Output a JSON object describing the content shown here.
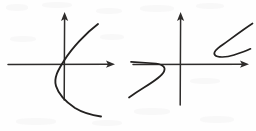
{
  "figure": {
    "medium": "pencil sketch on white paper",
    "background_color": "#fefefe",
    "ink_color": "#232120",
    "axis_color": "#2e2c2b",
    "panel_count": 2
  },
  "panels": [
    {
      "id": "left-graph",
      "name": "Sideways parabola opening right",
      "description": "A rightward-opening parabola whose vertex sits slightly left of the y-axis below the origin; the curve crosses the y-axis twice and both branches extend to the right.",
      "origin": {
        "x": 64,
        "y": 64
      },
      "axes": {
        "x_axis": {
          "start_x": 8,
          "end_x": 114,
          "y": 64,
          "arrow": "right"
        },
        "y_axis": {
          "x": 64,
          "start_y": 100,
          "end_y": 12,
          "arrow": "up"
        }
      },
      "curves": [
        {
          "id": "left-parabola",
          "name": "rightward-opening-parabola",
          "type": "parabola",
          "opens": "right",
          "vertex": {
            "x": 55,
            "y": 76
          },
          "upper_endpoint": {
            "x": 98,
            "y": 24
          },
          "lower_endpoint": {
            "x": 101,
            "y": 116
          },
          "stroke": "#232120"
        }
      ]
    },
    {
      "id": "right-graph",
      "name": "Two disconnected hook curves",
      "description": "A coordinate plane with a Z-shaped curve in the third quadrant below-left of the origin and a mirrored hook curve in the first quadrant above the x-axis on the right.",
      "origin": {
        "x": 180,
        "y": 64
      },
      "axes": {
        "x_axis": {
          "start_x": 133,
          "end_x": 248,
          "y": 64,
          "arrow": "right"
        },
        "y_axis": {
          "x": 180,
          "start_y": 105,
          "end_y": 12,
          "arrow": "up"
        }
      },
      "curves": [
        {
          "id": "lower-left-hook",
          "name": "z-shaped-curve-third-quadrant",
          "type": "hook",
          "quadrant": "third",
          "start_point": {
            "x": 131,
            "y": 62
          },
          "turn_point": {
            "x": 165,
            "y": 72
          },
          "end_point": {
            "x": 129,
            "y": 97
          },
          "stroke": "#232120"
        },
        {
          "id": "upper-right-hook",
          "name": "mirrored-hook-curve-first-quadrant",
          "type": "hook",
          "quadrant": "first",
          "start_point": {
            "x": 252,
            "y": 24
          },
          "turn_point": {
            "x": 214,
            "y": 50
          },
          "end_point": {
            "x": 250,
            "y": 49
          },
          "stroke": "#232120"
        }
      ]
    }
  ],
  "accessibility": {
    "alt_text": "Two sketched graphs: on the left a parabola opening to the right, on the right two separate hook-shaped curve segments."
  }
}
